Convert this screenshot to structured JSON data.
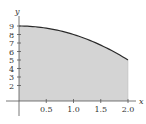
{
  "chart_data": {
    "type": "area",
    "title": "",
    "xlabel": "x",
    "ylabel": "y",
    "function": "y = 9 - x^2",
    "x": [
      0,
      0.25,
      0.5,
      0.75,
      1.0,
      1.25,
      1.5,
      1.75,
      2.0
    ],
    "values": [
      9,
      8.9375,
      8.75,
      8.4375,
      8,
      7.4375,
      6.75,
      5.9375,
      5
    ],
    "shaded_region": {
      "x_from": 0,
      "x_to": 2.0,
      "below_curve": true
    },
    "x_ticks": [
      "0.5",
      "1.0",
      "1.5",
      "2.0"
    ],
    "y_ticks": [
      "2",
      "3",
      "4",
      "5",
      "6",
      "7",
      "8",
      "9"
    ],
    "xlim": [
      0,
      2.2
    ],
    "ylim": [
      0,
      10
    ],
    "grid": false,
    "legend": null,
    "colors": {
      "fill": "#d4d4d4",
      "curve": "#2a2a2a",
      "axis": "#555555"
    }
  }
}
